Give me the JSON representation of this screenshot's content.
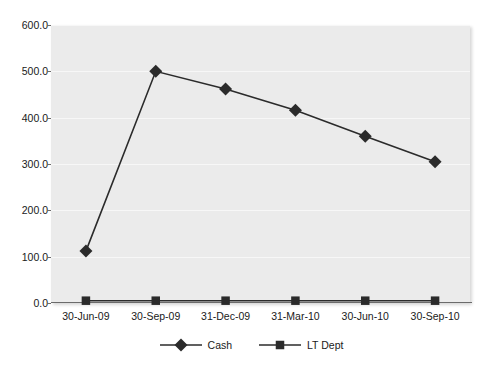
{
  "chart_data": {
    "type": "line",
    "title": "",
    "subtitle": "",
    "xlabel": "",
    "ylabel": "",
    "categories": [
      "30-Jun-09",
      "30-Sep-09",
      "31-Dec-09",
      "31-Mar-10",
      "30-Jun-10",
      "30-Sep-10"
    ],
    "series": [
      {
        "name": "Cash",
        "marker": "diamond",
        "color": "#2b2b2b",
        "values": [
          112.0,
          500.0,
          462.0,
          416.0,
          360.0,
          305.0
        ]
      },
      {
        "name": "LT Dept",
        "marker": "square",
        "color": "#2b2b2b",
        "values": [
          5.0,
          5.0,
          5.0,
          5.0,
          5.0,
          5.0
        ]
      }
    ],
    "ylim": [
      0.0,
      600.0
    ],
    "ytick_values": [
      600.0,
      500.0,
      400.0,
      300.0,
      200.0,
      100.0,
      0.0
    ],
    "ytick_labels": [
      "600.0",
      "500.0",
      "400.0",
      "300.0",
      "200.0",
      "100.0",
      "0.0"
    ],
    "grid": true,
    "grid_color": "#f7f7f7",
    "plot_background": "#ebebeb",
    "figure_background": "#ffffff",
    "legend_position": "bottom"
  }
}
